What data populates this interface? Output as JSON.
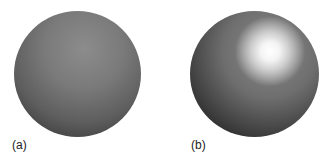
{
  "figure": {
    "panels": [
      {
        "label": "(a)",
        "description": "matte sphere, diffuse shading"
      },
      {
        "label": "(b)",
        "description": "glossy sphere with specular highlight"
      }
    ]
  }
}
